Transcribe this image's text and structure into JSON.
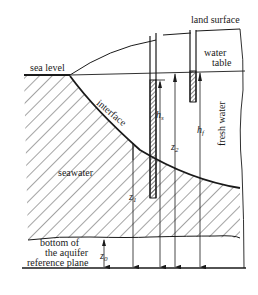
{
  "diagram": {
    "labels": {
      "land_surface": "land surface",
      "water_table_line1": "water",
      "water_table_line2": "table",
      "sea_level": "sea level",
      "interface": "interface",
      "fresh_water": "fresh water",
      "seawater": "seawater",
      "bottom_line1": "bottom of",
      "bottom_line2": "the aquifer",
      "reference_plane": "reference plane"
    },
    "symbols": {
      "h_s": "h",
      "h_s_sub": "s",
      "h_f": "h",
      "h_f_sub": "f",
      "z_1": "z",
      "z_1_sub": "1",
      "z_2": "z",
      "z_2_sub": "2",
      "z_0": "z",
      "z_0_sub": "0"
    },
    "colors": {
      "line": "#1a1a1a",
      "background": "#ffffff"
    }
  }
}
